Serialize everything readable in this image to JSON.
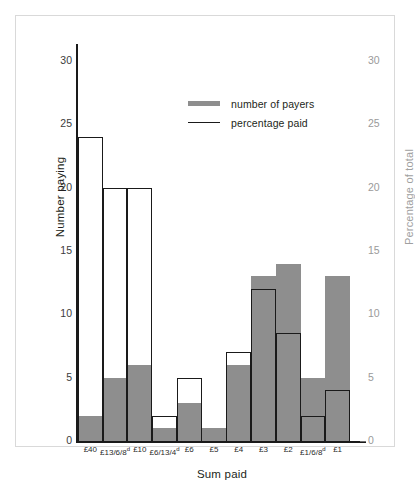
{
  "chart_data": {
    "type": "bar",
    "title": "",
    "xlabel": "Sum paid",
    "ylabel": "Number paying",
    "ylabel_right": "Percentage of total",
    "ylim": [
      0,
      30
    ],
    "ylim_right": [
      0,
      30
    ],
    "yticks": [
      0,
      5,
      10,
      15,
      20,
      25,
      30
    ],
    "yticks_right": [
      0,
      5,
      10,
      15,
      20,
      25,
      30
    ],
    "grid": false,
    "legend_position": "upper-center",
    "categories": [
      "£40",
      "£13/6/8ᵈ",
      "£10",
      "£6/13/4ᵈ",
      "£6",
      "£5",
      "£4",
      "£3",
      "£2",
      "£1/6/8ᵈ",
      "£1"
    ],
    "category_labels_html": [
      "£40",
      "£13/6/8<sup>d</sup>",
      "£10",
      "£6/13/4<sup>d</sup>",
      "£6",
      "£5",
      "£4",
      "£3",
      "£2",
      "£1/6/8<sup>d</sup>",
      "£1"
    ],
    "series": [
      {
        "name": "number of payers",
        "style": "filled-gray-bar",
        "axis": "left",
        "color": "#8e8e8e",
        "values": [
          2,
          5,
          6,
          1,
          3,
          1,
          6,
          13,
          14,
          5,
          13
        ]
      },
      {
        "name": "percentage paid",
        "style": "outlined-step-bar",
        "axis": "right",
        "color": "#1a1a1a",
        "values": [
          24,
          20,
          20,
          2,
          5,
          0,
          7,
          12,
          8.5,
          2,
          4
        ]
      }
    ]
  },
  "legend": {
    "items": [
      {
        "label": "number of payers",
        "swatch": "thick-gray-line"
      },
      {
        "label": "percentage paid",
        "swatch": "thin-black-line"
      }
    ]
  },
  "colors": {
    "bar_fill": "#8e8e8e",
    "outline": "#1a1a1a",
    "axis": "#1a1a1a",
    "right_axis_text": "#9a9a9a",
    "frame": "#d9d9d9",
    "background": "#ffffff"
  }
}
